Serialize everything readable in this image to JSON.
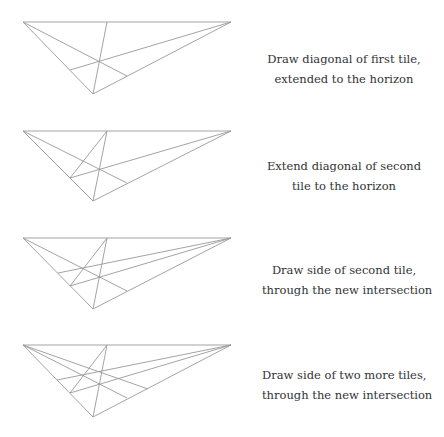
{
  "diagram": {
    "line_color": "#999999",
    "text_color": "#333333",
    "geometry": {
      "left_vertex": [
        23,
        0
      ],
      "right_vertex": [
        231,
        0
      ],
      "vertical_top": [
        107,
        0
      ],
      "bottom_vertex": [
        93,
        72
      ]
    },
    "panels": [
      {
        "top": 22,
        "caption": [
          "Draw diagonal of first tile,",
          "extended to the horizon"
        ],
        "caption_top": 49
      },
      {
        "top": 131,
        "caption": [
          "Extend diagonal of second",
          "tile to the horizon"
        ],
        "caption_top": 156
      },
      {
        "top": 238,
        "caption": [
          "Draw side of second tile,",
          "through the new intersection"
        ],
        "caption_top": 260
      },
      {
        "top": 345,
        "caption": [
          "Draw side of two more tiles,",
          "through the new intersection"
        ],
        "caption_top": 365
      }
    ]
  }
}
